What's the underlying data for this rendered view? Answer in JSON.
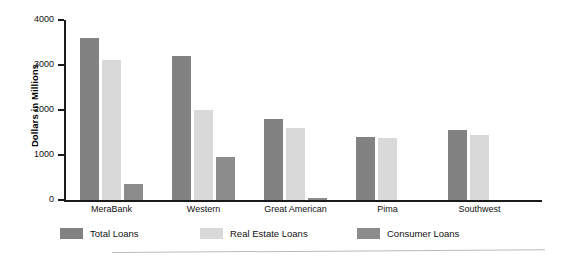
{
  "chart_data": {
    "type": "bar",
    "title": "",
    "subtitle": "",
    "xlabel": "",
    "ylabel": "Dollars in Millions",
    "ylim": [
      0,
      4000
    ],
    "yticks": [
      0,
      1000,
      2000,
      3000,
      4000
    ],
    "ytick_labels": [
      "0",
      "1000",
      "2000",
      "3000",
      "4000"
    ],
    "grid": false,
    "legend_position": "bottom",
    "categories": [
      "MeraBank",
      "Western",
      "Great American",
      "Pima",
      "Southwest"
    ],
    "series": [
      {
        "name": "Total Loans",
        "color": "#828282",
        "values": [
          3600,
          3200,
          1800,
          1400,
          1550
        ]
      },
      {
        "name": "Real Estate Loans",
        "color": "#d9d9d9",
        "values": [
          3120,
          2000,
          1600,
          1380,
          1450
        ]
      },
      {
        "name": "Consumer Loans",
        "color": "#8c8c8c",
        "values": [
          350,
          950,
          50,
          0,
          0
        ]
      }
    ]
  },
  "axis": {
    "y_title": "Dollars in Millions",
    "tick_0": "0",
    "tick_1000": "1000",
    "tick_2000": "2000",
    "tick_3000": "3000",
    "tick_4000": "4000"
  },
  "categories": {
    "c0": "MeraBank",
    "c1": "Western",
    "c2": "Great American",
    "c3": "Pima",
    "c4": "Southwest"
  },
  "legend": {
    "items": [
      {
        "label": "Total Loans",
        "color": "#828282"
      },
      {
        "label": "Real Estate Loans",
        "color": "#d9d9d9"
      },
      {
        "label": "Consumer Loans",
        "color": "#8c8c8c"
      }
    ]
  }
}
